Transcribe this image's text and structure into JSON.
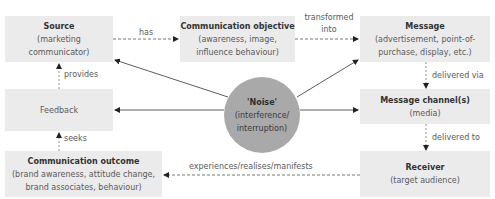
{
  "diagram": {
    "nodes": {
      "source": {
        "title": "Source",
        "lines": [
          "(marketing",
          "communicator)"
        ]
      },
      "objective": {
        "title": "Communication objective",
        "lines": [
          "(awareness, image,",
          "influence behaviour)"
        ]
      },
      "message": {
        "title": "Message",
        "lines": [
          "(advertisement, point-of-",
          "purchase, display, etc.)"
        ]
      },
      "feedback": {
        "title": "Feedback"
      },
      "noise": {
        "title": "'Noise'",
        "lines": [
          "(interference/",
          "interruption)"
        ]
      },
      "channel": {
        "title": "Message channel(s)",
        "lines": [
          "(media)"
        ]
      },
      "outcome": {
        "title": "Communication outcome",
        "lines": [
          "(brand awareness, attitude change,",
          "brand associates, behaviour)"
        ]
      },
      "receiver": {
        "title": "Receiver",
        "lines": [
          "(target audience)"
        ]
      }
    },
    "edges": {
      "has": "has",
      "transformed_into_1": "transformed",
      "transformed_into_2": "into",
      "delivered_via": "delivered via",
      "delivered_to": "delivered to",
      "experiences": "experiences/realises/manifests",
      "seeks": "seeks",
      "provides": "provides"
    },
    "colors": {
      "box_fill": "#ebebeb",
      "noise_fill": "#a9a9a9",
      "line": "#333333",
      "dashed_line": "#555555"
    }
  }
}
